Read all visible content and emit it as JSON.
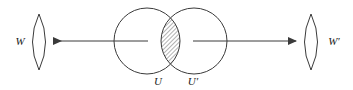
{
  "figure": {
    "type": "set-theory-venn-diagram",
    "background_color": "#ffffff",
    "stroke_color": "#3a3a3a",
    "hatch_color": "#555555",
    "labels": {
      "left_lens": "W",
      "right_lens": "W′",
      "left_circle": "U",
      "right_circle": "U′"
    },
    "shapes": {
      "left_lens": {
        "name": "lens-shape-w",
        "cx": 39,
        "cy": 42,
        "rx": 13,
        "ry": 28
      },
      "right_lens": {
        "name": "lens-shape-w-prime",
        "cx": 311,
        "cy": 42,
        "rx": 13,
        "ry": 28
      },
      "left_circle": {
        "name": "circle-u",
        "cx": 147,
        "cy": 41,
        "r": 33
      },
      "right_circle": {
        "name": "circle-u-prime",
        "cx": 194,
        "cy": 41,
        "r": 33
      },
      "intersection": {
        "name": "hatched-intersection",
        "fill": "diagonal-hatch"
      }
    },
    "arrows": {
      "left": {
        "name": "arrow-to-w",
        "direction": "left",
        "from_x": 147,
        "to_x": 54,
        "y": 41
      },
      "right": {
        "name": "arrow-to-w-prime",
        "direction": "right",
        "from_x": 194,
        "to_x": 296,
        "y": 41
      }
    }
  }
}
